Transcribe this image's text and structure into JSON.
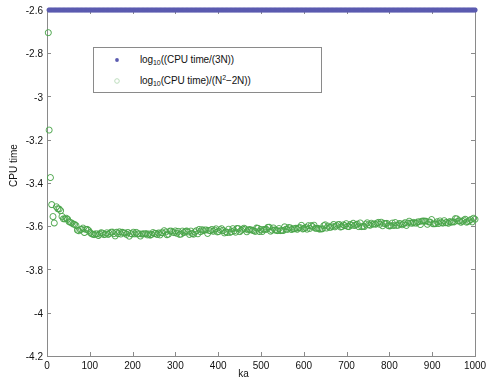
{
  "figure": {
    "background": "#ffffff",
    "plot_box": {
      "left": 47,
      "top": 10,
      "right": 475,
      "bottom": 356
    },
    "axis_color": "#8a8a8a"
  },
  "axis_titles": {
    "x": "ka",
    "y": "CPU time"
  },
  "legend": {
    "position": "top-left-inside",
    "box": {
      "left": 93,
      "top": 47,
      "width": 229,
      "height": 46
    },
    "entries": [
      {
        "marker": "filled-dot",
        "color": "#5b5bb0",
        "label_html": "log<sub>10</sub>((CPU time/(3N))",
        "label_text": "log10((CPU time/(3N))"
      },
      {
        "marker": "open-circle",
        "color": "#7fc27f",
        "label_html": "log<sub>10</sub>(CPU time)/(N<sup>2</sup>−2N))",
        "label_text": "log10(CPU time)/(N^2-2N))"
      }
    ]
  },
  "chart_data": {
    "type": "scatter",
    "title": "",
    "xlabel": "ka",
    "ylabel": "CPU time",
    "xlim": [
      0,
      1000
    ],
    "ylim": [
      -4.2,
      -2.6
    ],
    "grid": false,
    "xticks": [
      0,
      100,
      200,
      300,
      400,
      500,
      600,
      700,
      800,
      900,
      1000
    ],
    "xtick_labels": [
      "0",
      "100",
      "200",
      "300",
      "400",
      "500",
      "600",
      "700",
      "800",
      "900",
      "1000"
    ],
    "yticks": [
      -4.2,
      -4.0,
      -3.8,
      -3.6,
      -3.4,
      -3.2,
      -3.0,
      -2.8,
      -2.6
    ],
    "ytick_labels": [
      "-4.2",
      "-4",
      "-3.8",
      "-3.6",
      "-3.8",
      "-3.4",
      "-3.2",
      "-3",
      "-2.8",
      "-2.6"
    ],
    "ytick_labels_fixed": [
      "-4.2",
      "-4",
      "-3.8",
      "-3.6",
      "-3.4",
      "-3.2",
      "-3",
      "-2.8",
      "-2.6"
    ],
    "series": [
      {
        "name": "log10((CPU time/(3N))",
        "marker": "filled-dot",
        "color": "#5b5bb0",
        "marker_size": 2.6,
        "generator": {
          "kind": "sawtooth-scatter",
          "n_points": 330,
          "x_start": 5,
          "x_end": 1000,
          "baseline_start": -3.62,
          "baseline_end": -4.06,
          "baseline_knee_x": 230,
          "baseline_knee_y": -3.99,
          "streak_period_start": 26,
          "streak_period_end": 52,
          "streak_amp_start": 0.15,
          "streak_amp_end": 0.035,
          "jitter": 0.016,
          "seed": 20250411
        },
        "notes": "Dense blue cloud of small filled dots forming repeating short descending/ascending diagonal streaks; spread is wide near ka<250 (from -3.6 down to -4.2) and narrows to a thin band near -4.05 by ka=1000."
      },
      {
        "name": "log10(CPU time)/(N^2-2N))",
        "marker": "open-circle",
        "color": "#4ca64c",
        "marker_size": 3.0,
        "generator": {
          "kind": "decay-band",
          "n_points": 300,
          "x_start": 22,
          "x_end": 1000,
          "y_asymptote": -3.645,
          "y_start": -3.5,
          "decay_x": 34,
          "drift_end": 0.075,
          "jitter": 0.011,
          "seed": 777
        },
        "outliers": [
          {
            "x": 3,
            "y": -2.705
          },
          {
            "x": 5,
            "y": -3.155
          },
          {
            "x": 8,
            "y": -3.375
          },
          {
            "x": 11,
            "y": -3.5
          },
          {
            "x": 14,
            "y": -3.555
          },
          {
            "x": 17,
            "y": -3.585
          }
        ],
        "notes": "Pale green open circles: a few high outliers at very small ka, then a steep drop into a tight band near -3.65 that drifts slowly upward to about -3.57 at ka=1000."
      }
    ]
  }
}
